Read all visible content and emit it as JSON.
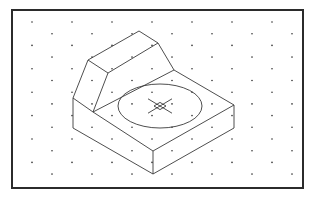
{
  "figure": {
    "type": "isometric-drawing",
    "frame": {
      "x": 12,
      "y": 10,
      "width": 291,
      "height": 178
    },
    "colors": {
      "line": "#3a3a3a",
      "frame": "#2b2b2b",
      "dot": "#333333",
      "background": "#ffffff"
    },
    "grid": {
      "type": "isometric-dots",
      "spacing_x": 20,
      "spacing_y": 11.7,
      "origin_x": 32,
      "origin_y": 22
    },
    "edges": [
      [
        139,
        31,
        158,
        43
      ],
      [
        88,
        60,
        139,
        31
      ],
      [
        108,
        73,
        158,
        43
      ],
      [
        88,
        60,
        108,
        73
      ],
      [
        158,
        43,
        174,
        70
      ],
      [
        88,
        60,
        73,
        98
      ],
      [
        108,
        73,
        93,
        112
      ],
      [
        73,
        98,
        93,
        112
      ],
      [
        73,
        98,
        73,
        128
      ],
      [
        93,
        112,
        174,
        70
      ],
      [
        174,
        70,
        234,
        105
      ],
      [
        93,
        112,
        153,
        151
      ],
      [
        153,
        151,
        234,
        105
      ],
      [
        73,
        128,
        153,
        174
      ],
      [
        153,
        174,
        234,
        128
      ],
      [
        153,
        151,
        153,
        174
      ],
      [
        234,
        105,
        234,
        128
      ]
    ],
    "hole": {
      "cx": 160,
      "cy": 106,
      "rx": 42,
      "ry": 22
    },
    "center_mark": {
      "cx": 160,
      "cy": 106,
      "size": 6,
      "arm": 12
    }
  }
}
